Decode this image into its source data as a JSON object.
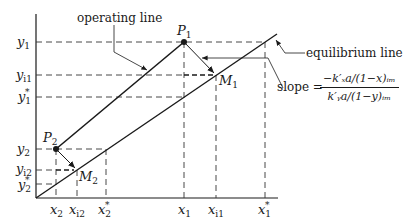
{
  "diagram": {
    "type": "mass-transfer operating/equilibrium line diagram",
    "labels": {
      "operating_line": "operating line",
      "equilibrium_line": "equilibrium line",
      "slope_prefix": "slope =",
      "slope_numerator": "−k′ₓa/(1−x)ᵢₘ",
      "slope_denominator": "k′ᵧa/(1−y)ᵢₘ"
    },
    "points": {
      "P1": {
        "main": "P",
        "sub": "1"
      },
      "P2": {
        "main": "P",
        "sub": "2"
      },
      "M1": {
        "main": "M",
        "sub": "1"
      },
      "M2": {
        "main": "M",
        "sub": "2"
      }
    },
    "y_ticks": [
      {
        "main": "y",
        "sub": "1",
        "star": ""
      },
      {
        "main": "y",
        "sub": "i1",
        "star": ""
      },
      {
        "main": "y",
        "sub": "1",
        "star": "*"
      },
      {
        "main": "y",
        "sub": "2",
        "star": ""
      },
      {
        "main": "y",
        "sub": "i2",
        "star": ""
      },
      {
        "main": "y",
        "sub": "2",
        "star": "*"
      }
    ],
    "x_ticks": [
      {
        "main": "x",
        "sub": "2",
        "star": ""
      },
      {
        "main": "x",
        "sub": "i2",
        "star": ""
      },
      {
        "main": "x",
        "sub": "2",
        "star": "*"
      },
      {
        "main": "x",
        "sub": "1",
        "star": ""
      },
      {
        "main": "x",
        "sub": "i1",
        "star": ""
      },
      {
        "main": "x",
        "sub": "1",
        "star": "*"
      }
    ]
  }
}
